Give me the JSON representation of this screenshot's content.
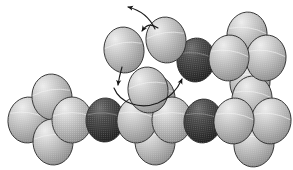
{
  "figure": {
    "type": "cpk-space-filling-model",
    "background_color": "#ffffff",
    "canvas": {
      "width": 293,
      "height": 170
    },
    "palette": {
      "light_sphere_base": "#b9b9b9",
      "light_sphere_highlight": "#e2e2e2",
      "light_sphere_shadow": "#8a8a8a",
      "dark_sphere_base": "#3a3a3a",
      "dark_sphere_highlight": "#6a6a6a",
      "dark_sphere_shadow": "#1b1b1b",
      "outline": "#2b2b2b",
      "arrow_color": "#1a1a1a"
    },
    "sphere_legend": [
      {
        "key": "light",
        "label": "light-gray atom",
        "color": "#b9b9b9"
      },
      {
        "key": "dark",
        "label": "dark atom (heteroatom)",
        "color": "#3a3a3a"
      }
    ],
    "atoms": [
      {
        "id": "a1",
        "name": "left-cluster-west-sphere",
        "cx": 28,
        "cy": 120,
        "rx": 20,
        "ry": 23,
        "shade": "light",
        "z": 1
      },
      {
        "id": "a2",
        "name": "left-cluster-north-sphere",
        "cx": 52,
        "cy": 97,
        "rx": 20,
        "ry": 23,
        "shade": "light",
        "z": 2
      },
      {
        "id": "a3",
        "name": "left-cluster-south-sphere",
        "cx": 53,
        "cy": 142,
        "rx": 20,
        "ry": 23,
        "shade": "light",
        "z": 2
      },
      {
        "id": "a4",
        "name": "left-cluster-center-sphere",
        "cx": 72,
        "cy": 120,
        "rx": 20,
        "ry": 23,
        "shade": "light",
        "z": 3
      },
      {
        "id": "a5",
        "name": "left-dark-sphere",
        "cx": 105,
        "cy": 120,
        "rx": 19,
        "ry": 22,
        "shade": "dark",
        "z": 3
      },
      {
        "id": "a6",
        "name": "chain-sphere-left",
        "cx": 137,
        "cy": 120,
        "rx": 20,
        "ry": 23,
        "shade": "light",
        "z": 3
      },
      {
        "id": "a7",
        "name": "chain-center-upper-sphere",
        "cx": 155,
        "cy": 98,
        "rx": 20,
        "ry": 23,
        "shade": "light",
        "z": 2
      },
      {
        "id": "a8",
        "name": "chain-center-lower-sphere",
        "cx": 155,
        "cy": 142,
        "rx": 20,
        "ry": 23,
        "shade": "light",
        "z": 2
      },
      {
        "id": "a9",
        "name": "chain-sphere-right",
        "cx": 172,
        "cy": 120,
        "rx": 20,
        "ry": 23,
        "shade": "light",
        "z": 3
      },
      {
        "id": "a10",
        "name": "right-dark-sphere",
        "cx": 203,
        "cy": 121,
        "rx": 19,
        "ry": 22,
        "shade": "dark",
        "z": 3
      },
      {
        "id": "a11",
        "name": "right-cluster-west-sphere",
        "cx": 234,
        "cy": 121,
        "rx": 20,
        "ry": 23,
        "shade": "light",
        "z": 3
      },
      {
        "id": "a12",
        "name": "right-cluster-north-sphere",
        "cx": 252,
        "cy": 99,
        "rx": 20,
        "ry": 23,
        "shade": "light",
        "z": 2
      },
      {
        "id": "a13",
        "name": "right-cluster-south-sphere",
        "cx": 254,
        "cy": 144,
        "rx": 20,
        "ry": 23,
        "shade": "light",
        "z": 2
      },
      {
        "id": "a14",
        "name": "right-cluster-east-sphere",
        "cx": 271,
        "cy": 121,
        "rx": 20,
        "ry": 23,
        "shade": "light",
        "z": 2
      },
      {
        "id": "a15",
        "name": "upper-dark-sphere",
        "cx": 196,
        "cy": 60,
        "rx": 19,
        "ry": 22,
        "shade": "dark",
        "z": 3
      },
      {
        "id": "a16",
        "name": "upper-right-cluster-west-sphere",
        "cx": 229,
        "cy": 58,
        "rx": 20,
        "ry": 23,
        "shade": "light",
        "z": 3
      },
      {
        "id": "a17",
        "name": "upper-right-cluster-north-sphere",
        "cx": 247,
        "cy": 35,
        "rx": 20,
        "ry": 23,
        "shade": "light",
        "z": 2
      },
      {
        "id": "a18",
        "name": "upper-right-cluster-east-sphere",
        "cx": 266,
        "cy": 58,
        "rx": 20,
        "ry": 23,
        "shade": "light",
        "z": 2
      },
      {
        "id": "a19",
        "name": "upper-right-cluster-south-sphere",
        "cx": 250,
        "cy": 82,
        "rx": 20,
        "ry": 23,
        "shade": "light",
        "z": 1
      },
      {
        "id": "a20",
        "name": "reacting-sphere-left",
        "cx": 124,
        "cy": 50,
        "rx": 20,
        "ry": 23,
        "shade": "light",
        "z": 3
      },
      {
        "id": "a21",
        "name": "reacting-sphere-right",
        "cx": 166,
        "cy": 40,
        "rx": 20,
        "ry": 23,
        "shade": "light",
        "z": 3
      },
      {
        "id": "a22",
        "name": "bridging-sphere-lower",
        "cx": 148,
        "cy": 90,
        "rx": 20,
        "ry": 23,
        "shade": "light",
        "z": 3
      }
    ],
    "arrows": [
      {
        "id": "a-out",
        "name": "curved-arrow-leaving-upper-left",
        "path": "M 155 29 C 150 18 140 10 128 7",
        "head": {
          "x": 128,
          "y": 7,
          "angle": 200
        },
        "description": "curved arrow pointing up and to the left, away from the molecule"
      },
      {
        "id": "a-in",
        "name": "curved-arrow-to-reacting-sphere-right",
        "path": "M 158 28 C 150 23 146 25 142 31",
        "head": {
          "x": 142,
          "y": 31,
          "angle": 125
        },
        "description": "short curved arrow pointing down-left onto the right reacting sphere"
      },
      {
        "id": "a-down-left",
        "name": "curved-arrow-down-from-left-reacting-sphere",
        "path": "M 122 67 C 120 74 119 78 118 85",
        "head": {
          "x": 118,
          "y": 86,
          "angle": 95
        },
        "description": "curved arrow descending from the left reacting sphere"
      },
      {
        "id": "a-loop",
        "name": "curved-arrow-loop-to-dark-sphere",
        "path": "M 114 88 C 120 103 140 110 158 103 C 170 98 178 88 182 79",
        "head": {
          "x": 183,
          "y": 77,
          "angle": -62
        },
        "description": "long curved arrow sweeping under the bridging sphere up to the upper dark sphere"
      }
    ]
  }
}
